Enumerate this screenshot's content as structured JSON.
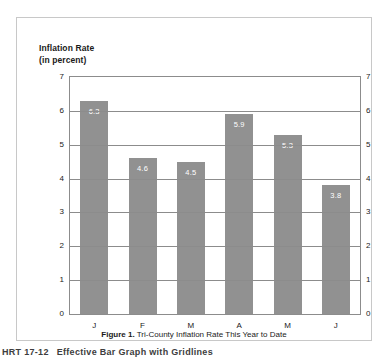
{
  "chart_data": {
    "type": "bar",
    "title": "Inflation Rate (in percent)",
    "title_lines": [
      "Inflation Rate",
      "(in percent)"
    ],
    "xlabel": "",
    "ylabel": "Inflation Rate (in percent)",
    "categories": [
      "J",
      "F",
      "M",
      "A",
      "M",
      "J"
    ],
    "values": [
      6.3,
      4.6,
      4.5,
      5.9,
      5.3,
      3.8
    ],
    "data_labels": [
      "6.3",
      "4.6",
      "4.5",
      "5.9",
      "5.3",
      "3.8"
    ],
    "ylim": [
      0,
      7
    ],
    "yticks": [
      0,
      1,
      2,
      3,
      4,
      5,
      6,
      7
    ],
    "ytick_labels": [
      "0",
      "1",
      "2",
      "3",
      "4",
      "5",
      "6",
      "7"
    ],
    "right_axis": true,
    "right_ytick_labels": [
      "0",
      "1",
      "2",
      "3",
      "4",
      "5",
      "6",
      "7"
    ],
    "grid": true,
    "legend": false,
    "bar_color": "#919191",
    "grid_color": "#8c8c8c",
    "label_color": "#ffffff"
  },
  "caption": {
    "label": "Figure 1.",
    "text": " Tri-County Inflation Rate This Year to Date"
  },
  "footer": {
    "code": "HRT 17-12",
    "text": "Effective Bar Graph with Gridlines"
  }
}
